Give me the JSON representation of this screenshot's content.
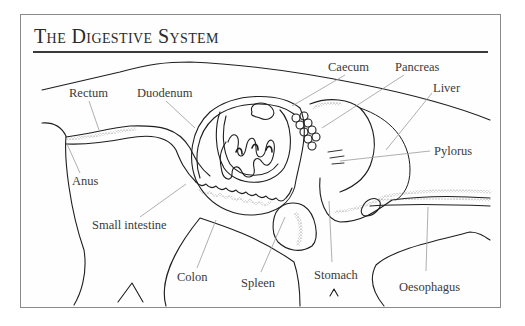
{
  "title": "The Digestive System",
  "colors": {
    "ink": "#1e1e1e",
    "leader": "#9a9a9a",
    "label": "#3a3a3a",
    "frame": "#8a8a8a",
    "stipple": "#555555"
  },
  "labels": [
    {
      "id": "caecum",
      "text": "Caecum",
      "x": 328,
      "y": 60,
      "leader": [
        [
          345,
          75
        ],
        [
          292,
          106
        ]
      ]
    },
    {
      "id": "pancreas",
      "text": "Pancreas",
      "x": 395,
      "y": 60,
      "leader": [
        [
          404,
          75
        ],
        [
          322,
          128
        ]
      ]
    },
    {
      "id": "liver",
      "text": "Liver",
      "x": 433,
      "y": 81,
      "leader": [
        [
          432,
          93
        ],
        [
          386,
          150
        ]
      ]
    },
    {
      "id": "rectum",
      "text": "Rectum",
      "x": 69,
      "y": 86,
      "leader": [
        [
          89,
          101
        ],
        [
          99,
          130
        ]
      ]
    },
    {
      "id": "duodenum",
      "text": "Duodenum",
      "x": 137,
      "y": 86,
      "leader": [
        [
          166,
          101
        ],
        [
          195,
          128
        ]
      ]
    },
    {
      "id": "pylorus",
      "text": "Pylorus",
      "x": 434,
      "y": 144,
      "leader": [
        [
          430,
          151
        ],
        [
          340,
          161
        ]
      ]
    },
    {
      "id": "anus",
      "text": "Anus",
      "x": 72,
      "y": 174,
      "leader": [
        [
          80,
          173
        ],
        [
          67,
          144
        ]
      ]
    },
    {
      "id": "small-intestine",
      "text": "Small intestine",
      "x": 92,
      "y": 218,
      "leader": [
        [
          140,
          217
        ],
        [
          186,
          184
        ]
      ]
    },
    {
      "id": "colon",
      "text": "Colon",
      "x": 177,
      "y": 270,
      "leader": [
        [
          197,
          268
        ],
        [
          216,
          220
        ]
      ]
    },
    {
      "id": "spleen",
      "text": "Spleen",
      "x": 241,
      "y": 276,
      "leader": [
        [
          261,
          272
        ],
        [
          285,
          217
        ]
      ]
    },
    {
      "id": "stomach",
      "text": "Stomach",
      "x": 314,
      "y": 268,
      "leader": [
        [
          332,
          262
        ],
        [
          329,
          201
        ]
      ]
    },
    {
      "id": "oesophagus",
      "text": "Oesophagus",
      "x": 399,
      "y": 280,
      "leader": [
        [
          426,
          271
        ],
        [
          428,
          207
        ]
      ]
    }
  ]
}
